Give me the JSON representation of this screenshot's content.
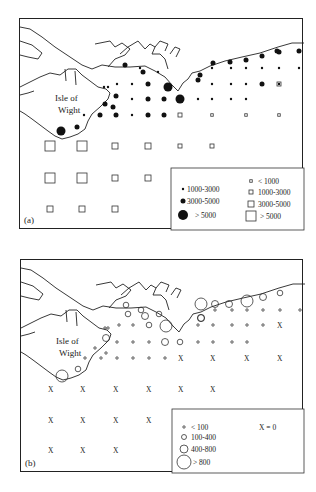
{
  "panels": [
    {
      "id": "a",
      "label": "(a)",
      "island_label": [
        "Isle of",
        "Wight"
      ],
      "legend": {
        "filled_circles": [
          {
            "size": "small",
            "label": "1000-3000"
          },
          {
            "size": "medium",
            "label": "3000-5000"
          },
          {
            "size": "large",
            "label": "> 5000"
          }
        ],
        "open_squares": [
          {
            "size": "xsmall",
            "label": "< 1000"
          },
          {
            "size": "small",
            "label": "1000-3000"
          },
          {
            "size": "medium",
            "label": "3000-5000"
          },
          {
            "size": "large",
            "label": "> 5000"
          }
        ]
      },
      "stations": [
        {
          "col": 0,
          "row": 0,
          "sym": "dot",
          "cls": 1
        },
        {
          "col": 0,
          "row": 1,
          "sym": "dot",
          "cls": 2
        },
        {
          "col": 0,
          "row": 2,
          "sym": "dot",
          "cls": 1
        },
        {
          "col": 1,
          "row": 1,
          "sym": "dot",
          "cls": 1
        },
        {
          "col": 1,
          "row": 2,
          "sym": "dot",
          "cls": 2
        },
        {
          "col": 1,
          "row": 3,
          "sym": "dot",
          "cls": 2
        },
        {
          "col": 2,
          "row": 0,
          "sym": "dot",
          "cls": 1
        },
        {
          "col": 2,
          "row": 1,
          "sym": "dot",
          "cls": 2
        },
        {
          "col": 2,
          "row": 2,
          "sym": "dot",
          "cls": 1
        },
        {
          "col": 2,
          "row": 3,
          "sym": "dot",
          "cls": 2
        }
      ]
    },
    {
      "id": "b",
      "label": "(b)",
      "island_label": [
        "Isle of",
        "Wight"
      ],
      "legend": {
        "open_circles": [
          {
            "size": "xsmall",
            "label": "< 100"
          },
          {
            "size": "small",
            "label": "100-400"
          },
          {
            "size": "medium",
            "label": "400-800"
          },
          {
            "size": "large",
            "label": "> 800"
          }
        ],
        "cross": {
          "label": "X = 0"
        }
      }
    }
  ]
}
